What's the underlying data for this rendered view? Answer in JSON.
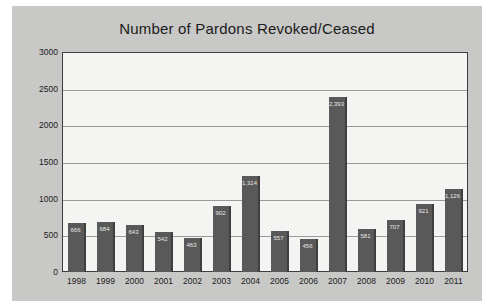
{
  "chart_data": {
    "type": "bar",
    "title": "Number of Pardons Revoked/Ceased",
    "xlabel": "",
    "ylabel": "",
    "ylim": [
      0,
      3000
    ],
    "ytick_step": 500,
    "grid": true,
    "legend": "none",
    "categories": [
      "1998",
      "1999",
      "2000",
      "2001",
      "2002",
      "2003",
      "2004",
      "2005",
      "2006",
      "2007",
      "2008",
      "2009",
      "2010",
      "2011"
    ],
    "values": [
      666,
      684,
      643,
      542,
      463,
      902,
      1314,
      557,
      456,
      2393,
      581,
      707,
      921,
      1126
    ],
    "value_labels": [
      "666",
      "684",
      "643",
      "542",
      "463",
      "902",
      "1,314",
      "557",
      "456",
      "2,393",
      "581",
      "707",
      "921",
      "1,126"
    ],
    "ytick_labels": [
      "3000",
      "2500",
      "2000",
      "1500",
      "1000",
      "500",
      "0"
    ],
    "ytick_values": [
      3000,
      2500,
      2000,
      1500,
      1000,
      500,
      0
    ],
    "colors": {
      "bar": "#595959",
      "bar_edge": "#3f3f3f",
      "plot_background": "#f4f4f2",
      "canvas_background": "#c8c8c6",
      "gridline": "#9a9a98",
      "axis_border": "#3d3d3d",
      "text": "#1b1b1b",
      "value_label_text": "#e8e8e8"
    }
  }
}
